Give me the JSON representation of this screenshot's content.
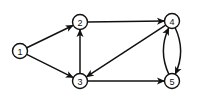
{
  "graph": {
    "type": "directed",
    "node_radius": 7.5,
    "color": "#111111",
    "nodes": [
      {
        "id": "1",
        "label": "1",
        "x": 20,
        "y": 51
      },
      {
        "id": "2",
        "label": "2",
        "x": 80,
        "y": 22
      },
      {
        "id": "3",
        "label": "3",
        "x": 80,
        "y": 81
      },
      {
        "id": "4",
        "label": "4",
        "x": 172,
        "y": 21
      },
      {
        "id": "5",
        "label": "5",
        "x": 172,
        "y": 81
      }
    ],
    "edges": [
      {
        "from": "1",
        "to": "2",
        "curve": 0
      },
      {
        "from": "1",
        "to": "3",
        "curve": 0
      },
      {
        "from": "3",
        "to": "2",
        "curve": 0
      },
      {
        "from": "2",
        "to": "4",
        "curve": 0
      },
      {
        "from": "4",
        "to": "3",
        "curve": 0
      },
      {
        "from": "3",
        "to": "5",
        "curve": 0
      },
      {
        "from": "4",
        "to": "5",
        "curve": -14
      },
      {
        "from": "5",
        "to": "4",
        "curve": -14
      }
    ]
  }
}
